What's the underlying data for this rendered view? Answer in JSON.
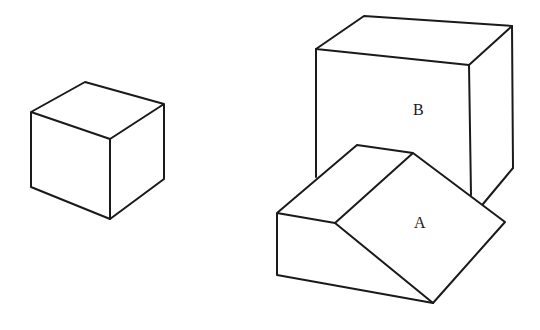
{
  "figure": {
    "stroke_color": "#1a1a1a",
    "background": "#ffffff"
  },
  "shapes": {
    "cube": {
      "label": ""
    },
    "box_b": {
      "label": "B"
    },
    "wedge_a": {
      "label": "A"
    }
  }
}
